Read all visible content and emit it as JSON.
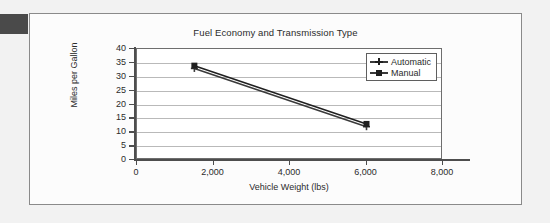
{
  "corner_mark": {
    "color": "#4a4a4a"
  },
  "card": {
    "background": "#fcfcfc",
    "border_color": "#8a8a8a"
  },
  "chart_data": {
    "type": "line",
    "title": "Fuel Economy and Transmission Type",
    "xlabel": "Vehicle Weight (lbs)",
    "ylabel": "Miles per Gallon",
    "xlim": [
      0,
      8000
    ],
    "ylim": [
      0,
      40
    ],
    "xticks": [
      0,
      2000,
      4000,
      6000,
      8000
    ],
    "xtick_labels": [
      "0",
      "2,000",
      "4,000",
      "6,000",
      "8,000"
    ],
    "yticks": [
      0,
      5,
      10,
      15,
      20,
      25,
      30,
      35,
      40
    ],
    "ytick_labels": [
      "0",
      "5",
      "10",
      "15",
      "20",
      "25",
      "30",
      "35",
      "40"
    ],
    "grid": {
      "horizontal": true,
      "vertical": false,
      "color": "#b9b9b9"
    },
    "legend": {
      "position": "top-right-inside",
      "border_color": "#5f5f5f"
    },
    "series": [
      {
        "name": "Automatic",
        "marker": "cross",
        "color": "#3a3a3a",
        "x": [
          1500,
          6000
        ],
        "values": [
          33,
          12
        ]
      },
      {
        "name": "Manual",
        "marker": "square",
        "color": "#1f1f1f",
        "x": [
          1500,
          6000
        ],
        "values": [
          34,
          13
        ]
      }
    ]
  }
}
